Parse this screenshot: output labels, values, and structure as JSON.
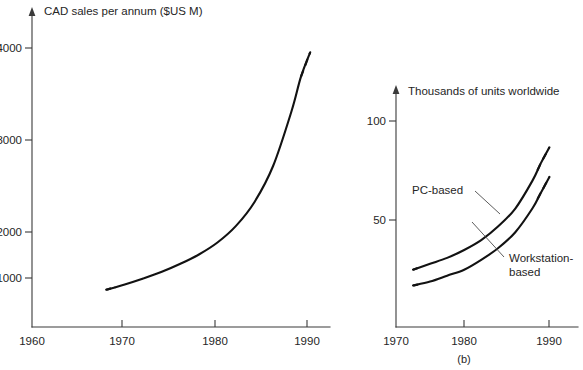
{
  "figure": {
    "background": "#ffffff",
    "ink_color": "#121212",
    "axis_color": "#3a3a3a",
    "width": 583,
    "height": 370
  },
  "chart_data": [
    {
      "id": "cad-sales",
      "type": "line",
      "title": "CAD sales per annum ($US M)",
      "xlabel": "",
      "ylabel": "CAD sales per annum ($US M)",
      "xlim": [
        1960,
        1993
      ],
      "ylim": [
        0,
        4600
      ],
      "xticks": [
        1960,
        1970,
        1980,
        1990
      ],
      "xtick_labels": [
        "1960",
        "1970",
        "1980",
        "1990"
      ],
      "yticks": [
        1000,
        2000,
        3000,
        4000
      ],
      "ytick_labels": [
        "1000",
        "2000",
        "3000",
        "4000"
      ],
      "grid": false,
      "legend": "none",
      "series": [
        {
          "name": "CAD sales",
          "style": "solid-with-dashed-ends",
          "x": [
            1968,
            1970,
            1972,
            1974,
            1976,
            1978,
            1980,
            1982,
            1984,
            1986,
            1988,
            1989,
            1990
          ],
          "values": [
            560,
            640,
            730,
            830,
            950,
            1090,
            1270,
            1520,
            1880,
            2420,
            3250,
            3760,
            4130
          ],
          "dashed_head_from": 1968,
          "dashed_head_to": 1969,
          "dashed_tail_from": 1989,
          "dashed_tail_to": 1990
        }
      ]
    },
    {
      "id": "units-worldwide",
      "type": "line",
      "title": "Thousands of units worldwide",
      "caption": "(b)",
      "xlabel": "",
      "ylabel": "Thousands of units worldwide",
      "xlim": [
        1970,
        1993
      ],
      "ylim": [
        0,
        118
      ],
      "xticks": [
        1970,
        1980,
        1990
      ],
      "xtick_labels": [
        "1970",
        "1980",
        "1990"
      ],
      "yticks": [
        50,
        100
      ],
      "ytick_labels": [
        "50",
        "100"
      ],
      "grid": false,
      "legend": "inline-annotations",
      "series": [
        {
          "name": "PC-based",
          "label": "PC-based",
          "style": "solid-with-dashed-ends",
          "x": [
            1972,
            1974,
            1976,
            1978,
            1980,
            1982,
            1984,
            1986,
            1987,
            1988
          ],
          "values": [
            29,
            32,
            35,
            39,
            44,
            51,
            60,
            74,
            83,
            91
          ],
          "dashed_head_from": 1972,
          "dashed_head_to": 1972.6,
          "dashed_tail_from": 1986.6,
          "dashed_tail_to": 1988
        },
        {
          "name": "Workstation-based",
          "label": "Workstation-\nbased",
          "label_line1": "Workstation-",
          "label_line2": "based",
          "style": "solid-with-dashed-ends",
          "x": [
            1972,
            1974,
            1976,
            1978,
            1980,
            1982,
            1984,
            1986,
            1987,
            1988
          ],
          "values": [
            21,
            23,
            26,
            29,
            34,
            40,
            48,
            60,
            68,
            76
          ],
          "dashed_head_from": 1972,
          "dashed_head_to": 1972.6,
          "dashed_tail_from": 1986.6,
          "dashed_tail_to": 1988
        }
      ]
    }
  ]
}
